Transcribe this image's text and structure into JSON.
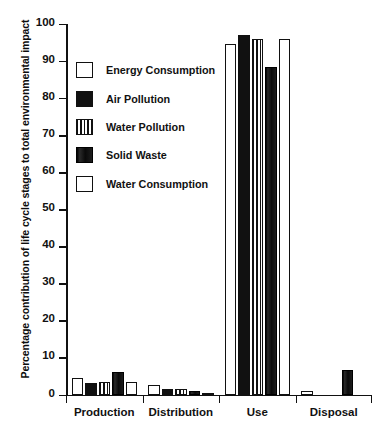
{
  "chart_data": {
    "type": "bar",
    "title": "",
    "xlabel": "",
    "ylabel": "Percentage contribution of life cycle stages to total environmental impact",
    "ylim": [
      0,
      100
    ],
    "yticks": [
      0,
      10,
      20,
      30,
      40,
      50,
      60,
      70,
      80,
      90,
      100
    ],
    "grid": false,
    "legend_position": "upper-left-inside",
    "categories": [
      "Production",
      "Distribution",
      "Use",
      "Disposal"
    ],
    "series": [
      {
        "name": "Energy Consumption",
        "swatch": "white-open-square",
        "values": [
          4.5,
          2.5,
          94.5,
          1.0
        ]
      },
      {
        "name": "Air Pollution",
        "swatch": "black-filled-square",
        "values": [
          3.0,
          1.5,
          97.0,
          0.0
        ]
      },
      {
        "name": "Water Pollution",
        "swatch": "vertical-striped-square",
        "values": [
          3.5,
          1.5,
          96.0,
          0.0
        ]
      },
      {
        "name": "Solid Waste",
        "swatch": "dark-filled-square",
        "values": [
          6.0,
          1.0,
          88.5,
          6.5
        ]
      },
      {
        "name": "Water Consumption",
        "swatch": "white-open-square",
        "values": [
          3.5,
          0.5,
          96.0,
          0.0
        ]
      }
    ]
  },
  "axis": {
    "y_title": "Percentage contribution of life cycle stages to total environmental impact",
    "tick_labels": [
      "0",
      "10",
      "20",
      "30",
      "40",
      "50",
      "60",
      "70",
      "80",
      "90",
      "100"
    ]
  },
  "legend": {
    "items": [
      {
        "label": "Energy Consumption"
      },
      {
        "label": "Air Pollution"
      },
      {
        "label": "Water Pollution"
      },
      {
        "label": "Solid Waste"
      },
      {
        "label": "Water Consumption"
      }
    ]
  },
  "groups": [
    {
      "label": "Production"
    },
    {
      "label": "Distribution"
    },
    {
      "label": "Use"
    },
    {
      "label": "Disposal"
    }
  ]
}
